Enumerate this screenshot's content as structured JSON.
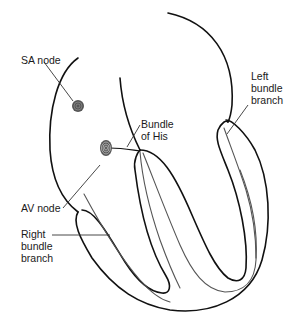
{
  "labels": {
    "sa_node": "SA node",
    "bundle_of_his": "Bundle\nof His",
    "left_bundle_branch": "Left\nbundle\nbranch",
    "av_node": "AV node",
    "right_bundle_branch": "Right\nbundle\nbranch"
  },
  "colors": {
    "outline": "#111111",
    "inner_path": "#555555",
    "node_fill": "#555555",
    "background": "#ffffff"
  }
}
